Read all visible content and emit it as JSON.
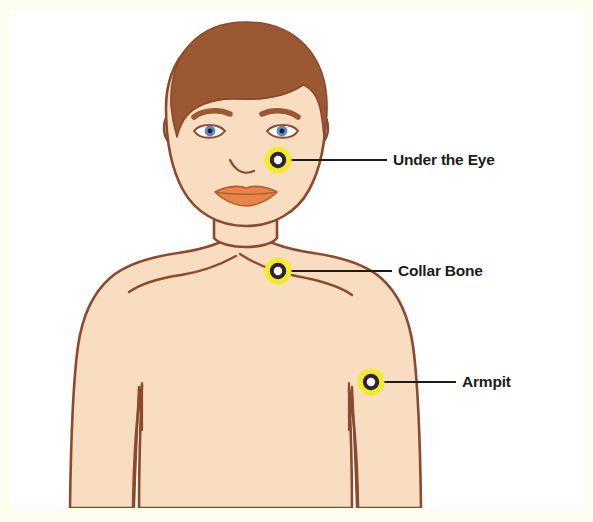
{
  "figure": {
    "background_color": "#fdfdf0",
    "canvas_color": "#ffffff",
    "skin_color": "#f8ddc0",
    "skin_outline_color": "#8b4a2e",
    "hair_color": "#9c5733",
    "lip_color": "#e8834a",
    "iris_color": "#5f86c9",
    "pupil_color": "#1b2230",
    "eye_white_color": "#ffffff",
    "marker_halo_color": "#f2ea2a",
    "marker_ring_color": "#2a2340",
    "marker_center_color": "#ffffff",
    "leader_line_color": "#1b1b1b",
    "label_text_color": "#1b1b1b"
  },
  "markers": [
    {
      "id": "under-the-eye",
      "label": "Under the Eye",
      "point_x": 278,
      "point_y": 160,
      "leader_start_x": 291,
      "leader_start_y": 160,
      "leader_end_x": 387,
      "leader_end_y": 160
    },
    {
      "id": "collar-bone",
      "label": "Collar Bone",
      "point_x": 278,
      "point_y": 271,
      "leader_start_x": 291,
      "leader_start_y": 271,
      "leader_end_x": 392,
      "leader_end_y": 271
    },
    {
      "id": "armpit",
      "label": "Armpit",
      "point_x": 371,
      "point_y": 382,
      "leader_start_x": 384,
      "leader_start_y": 382,
      "leader_end_x": 456,
      "leader_end_y": 382
    }
  ]
}
